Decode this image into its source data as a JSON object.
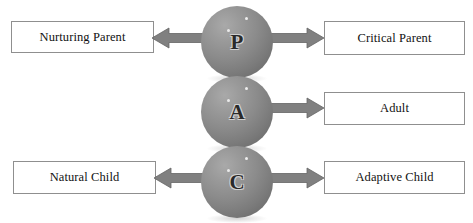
{
  "diagram": {
    "type": "ego-state-structural-diagram",
    "colors": {
      "sphere_gray": "#8b8b8b",
      "sphere_highlight": "#a9a9a9",
      "sphere_shade": "#5f5f5f",
      "arrow_gray": "#808080",
      "arrow_outline": "#5a5a5a",
      "box_border": "#8f8f8f",
      "box_fill": "#ffffff",
      "text_color": "#111111",
      "background": "#ffffff"
    },
    "nodes": [
      {
        "id": "parent",
        "letter": "P",
        "name": "Parent"
      },
      {
        "id": "adult",
        "letter": "A",
        "name": "Adult"
      },
      {
        "id": "child",
        "letter": "C",
        "name": "Child"
      }
    ],
    "labels": {
      "nurturing_parent": "Nurturing Parent",
      "critical_parent": "Critical Parent",
      "adult": "Adult",
      "natural_child": "Natural Child",
      "adaptive_child": "Adaptive Child"
    },
    "arrows": [
      {
        "id": "parent-to-nurturing",
        "direction": "left",
        "from": "parent",
        "to": "nurturing_parent"
      },
      {
        "id": "parent-to-critical",
        "direction": "right",
        "from": "parent",
        "to": "critical_parent"
      },
      {
        "id": "adult-to-adult",
        "direction": "right",
        "from": "adult",
        "to": "adult"
      },
      {
        "id": "child-to-natural",
        "direction": "left",
        "from": "child",
        "to": "natural_child"
      },
      {
        "id": "child-to-adaptive",
        "direction": "right",
        "from": "child",
        "to": "adaptive_child"
      }
    ]
  }
}
